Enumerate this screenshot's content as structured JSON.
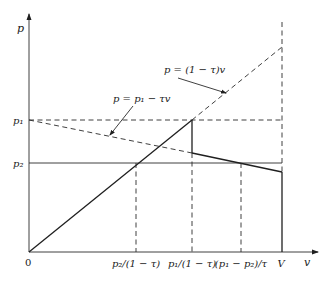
{
  "diagram": {
    "axes": {
      "y_label": "p",
      "x_label": "v",
      "origin_label": "0"
    },
    "y_ticks": [
      {
        "id": "p1",
        "label": "p₁"
      },
      {
        "id": "p2",
        "label": "p₂"
      }
    ],
    "x_ticks": [
      {
        "id": "p2_over_1_minus_tau",
        "label": "p₂/(1 − τ)"
      },
      {
        "id": "p1_over_1_minus_tau",
        "label": "p₁/(1 − τ)"
      },
      {
        "id": "p1_minus_p2_over_tau",
        "label": "(p₁ − p₂)/τ"
      },
      {
        "id": "V",
        "label": "V"
      }
    ],
    "annotations": [
      {
        "id": "rising_line",
        "label": "p = (1 − τ)v"
      },
      {
        "id": "falling_line",
        "label": "p = p₁ − τv"
      }
    ],
    "colors": {
      "line": "#1f1f1f",
      "background": "#ffffff"
    }
  }
}
